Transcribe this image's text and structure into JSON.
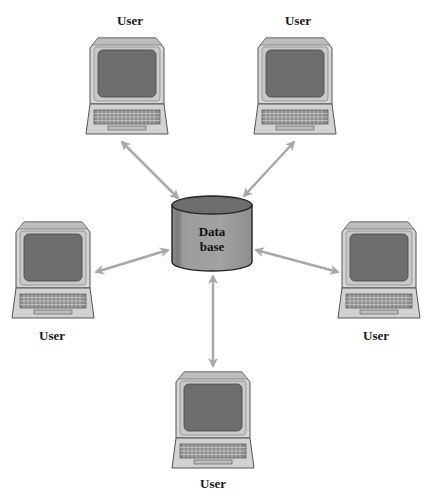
{
  "diagram": {
    "type": "star-network",
    "center": {
      "label_line1": "Data",
      "label_line2": "base",
      "shape": "cylinder"
    },
    "nodes": [
      {
        "id": "user-top-left",
        "label": "User",
        "position": "top-left"
      },
      {
        "id": "user-top-right",
        "label": "User",
        "position": "top-right"
      },
      {
        "id": "user-left",
        "label": "User",
        "position": "left"
      },
      {
        "id": "user-right",
        "label": "User",
        "position": "right"
      },
      {
        "id": "user-bottom",
        "label": "User",
        "position": "bottom"
      }
    ],
    "edges": [
      {
        "from": "database",
        "to": "user-top-left",
        "style": "bidirectional-arrow"
      },
      {
        "from": "database",
        "to": "user-top-right",
        "style": "bidirectional-arrow"
      },
      {
        "from": "database",
        "to": "user-left",
        "style": "bidirectional-arrow"
      },
      {
        "from": "database",
        "to": "user-right",
        "style": "bidirectional-arrow"
      },
      {
        "from": "database",
        "to": "user-bottom",
        "style": "bidirectional-arrow"
      }
    ],
    "colors": {
      "arrow": "#a8a8a8",
      "cylinder_body": "#9a9a9a",
      "cylinder_top": "#6e6e6e",
      "terminal_case": "#d4d4d4",
      "terminal_screen": "#6f6f6f",
      "terminal_outline": "#555555"
    }
  }
}
